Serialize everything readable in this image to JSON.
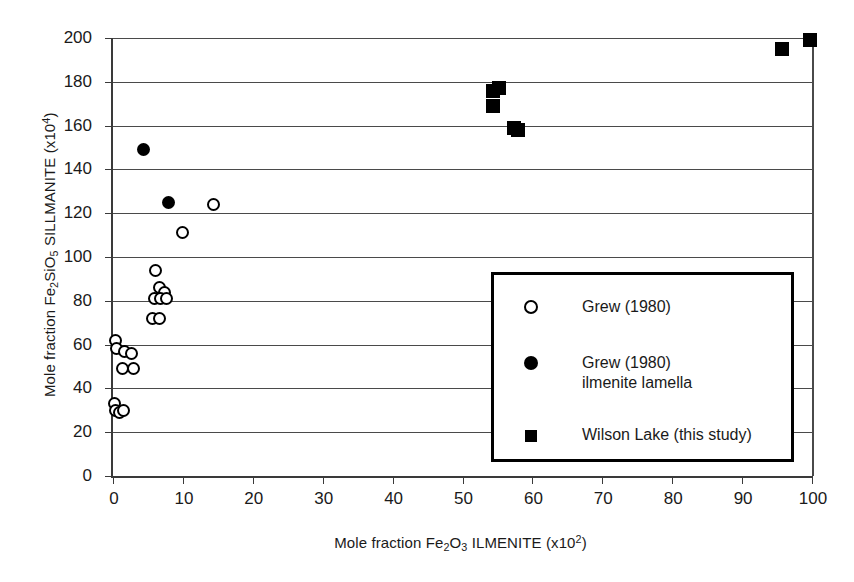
{
  "chart_data": {
    "type": "scatter",
    "title": "",
    "xlabel": "Mole fraction Fe2O3 ILMENITE (x10^2)",
    "ylabel": "Mole fraction Fe2SiO5 SILLMANITE (x10^4)",
    "xlabel_parts": {
      "prefix": "Mole fraction Fe",
      "sub1": "2",
      "mid": "O",
      "sub2": "3",
      "suffix": " ILMENITE (x10",
      "sup": "2",
      "tail": ")"
    },
    "ylabel_parts": {
      "prefix": "Mole fraction Fe",
      "sub1": "2",
      "mid": "SiO",
      "sub2": "5",
      "suffix": " SILLMANITE (x10",
      "sup": "4",
      "tail": ")"
    },
    "xlim": [
      0,
      100
    ],
    "ylim": [
      0,
      200
    ],
    "xticks": [
      0,
      10,
      20,
      30,
      40,
      50,
      60,
      70,
      80,
      90,
      100
    ],
    "yticks": [
      0,
      20,
      40,
      60,
      80,
      100,
      120,
      140,
      160,
      180,
      200
    ],
    "xtick_labels": [
      "0",
      "10",
      "20",
      "30",
      "40",
      "50",
      "60",
      "70",
      "80",
      "90",
      "100"
    ],
    "ytick_labels": [
      "0",
      "20",
      "40",
      "60",
      "80",
      "100",
      "120",
      "140",
      "160",
      "180",
      "200"
    ],
    "grid": "horizontal",
    "legend_position": "lower-right-inset",
    "series": [
      {
        "name": "Grew (1980)",
        "marker": "open-circle",
        "color": "#000000",
        "points": [
          [
            0.3,
            62
          ],
          [
            0.5,
            58
          ],
          [
            1.6,
            57
          ],
          [
            2.6,
            56
          ],
          [
            1.4,
            49
          ],
          [
            2.9,
            49
          ],
          [
            0.2,
            33
          ],
          [
            0.4,
            30
          ],
          [
            0.9,
            29
          ],
          [
            1.5,
            30
          ],
          [
            6.1,
            94
          ],
          [
            6.6,
            86
          ],
          [
            7.4,
            84
          ],
          [
            5.9,
            81
          ],
          [
            6.8,
            81
          ],
          [
            7.6,
            81
          ],
          [
            5.7,
            72
          ],
          [
            6.6,
            72
          ],
          [
            9.9,
            111
          ],
          [
            14.4,
            124
          ]
        ]
      },
      {
        "name": "Grew (1980)\nilmenite lamella",
        "marker": "filled-circle",
        "color": "#000000",
        "points": [
          [
            4.3,
            149
          ],
          [
            8.0,
            125
          ]
        ]
      },
      {
        "name": "Wilson Lake (this study)",
        "marker": "filled-square",
        "color": "#000000",
        "points": [
          [
            54.3,
            176
          ],
          [
            55.2,
            177
          ],
          [
            54.3,
            169
          ],
          [
            57.3,
            159
          ],
          [
            58.0,
            158
          ],
          [
            95.7,
            195
          ],
          [
            99.7,
            199
          ]
        ]
      }
    ]
  },
  "legend": {
    "entries": [
      {
        "label": "Grew (1980)",
        "marker": "open-circle"
      },
      {
        "label": "Grew (1980)\nilmenite lamella",
        "marker": "filled-circle"
      },
      {
        "label": "Wilson Lake (this study)",
        "marker": "filled-square"
      }
    ]
  }
}
